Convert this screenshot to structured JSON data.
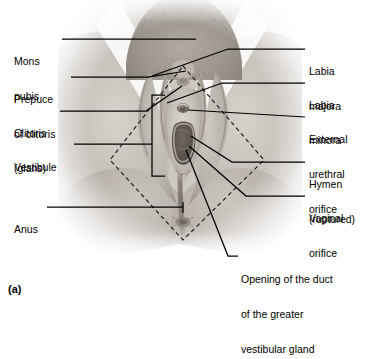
{
  "figure": {
    "caption": "(a)",
    "image_kind": "photograph-of-female-external-genitalia",
    "background_color": "#ffffff",
    "leader_line_color": "#000000",
    "dashed_outline_color": "#1a1a1a",
    "photo_tint": "#9d9791"
  },
  "labels_left": [
    {
      "id": "mons-pubis",
      "line1": "Mons",
      "line2": "pubis",
      "x": 14,
      "y": 33
    },
    {
      "id": "prepuce-of-clitoris",
      "line1": "Prepuce",
      "line2": "of clitoris",
      "x": 14,
      "y": 71
    },
    {
      "id": "clitoris-glans",
      "line1": "Clitoris",
      "line2": "(glans)",
      "x": 14,
      "y": 105
    },
    {
      "id": "vestibule",
      "line1": "Vestibule",
      "line2": "",
      "x": 14,
      "y": 139
    },
    {
      "id": "anus",
      "line1": "Anus",
      "line2": "",
      "x": 14,
      "y": 201
    }
  ],
  "labels_right": [
    {
      "id": "labia-majora",
      "line1": "Labia",
      "line2": "majora",
      "x": 309,
      "y": 43
    },
    {
      "id": "labia-minora",
      "line1": "Labia",
      "line2": "minora",
      "x": 309,
      "y": 77
    },
    {
      "id": "external-urethral-orifice",
      "line1": "External",
      "line2": "urethral",
      "line3": "orifice",
      "x": 309,
      "y": 111
    },
    {
      "id": "hymen-ruptured",
      "line1": "Hymen",
      "line2": "(ruptured)",
      "x": 309,
      "y": 156
    },
    {
      "id": "vaginal-orifice",
      "line1": "Vaginal",
      "line2": "orifice",
      "x": 309,
      "y": 190
    }
  ],
  "labels_bottom": [
    {
      "id": "opening-of-duct-of-greater-vestibular-gland",
      "line1": "Opening of the duct",
      "line2": "of the greater",
      "line3": "vestibular gland",
      "x": 241,
      "y": 251
    }
  ]
}
